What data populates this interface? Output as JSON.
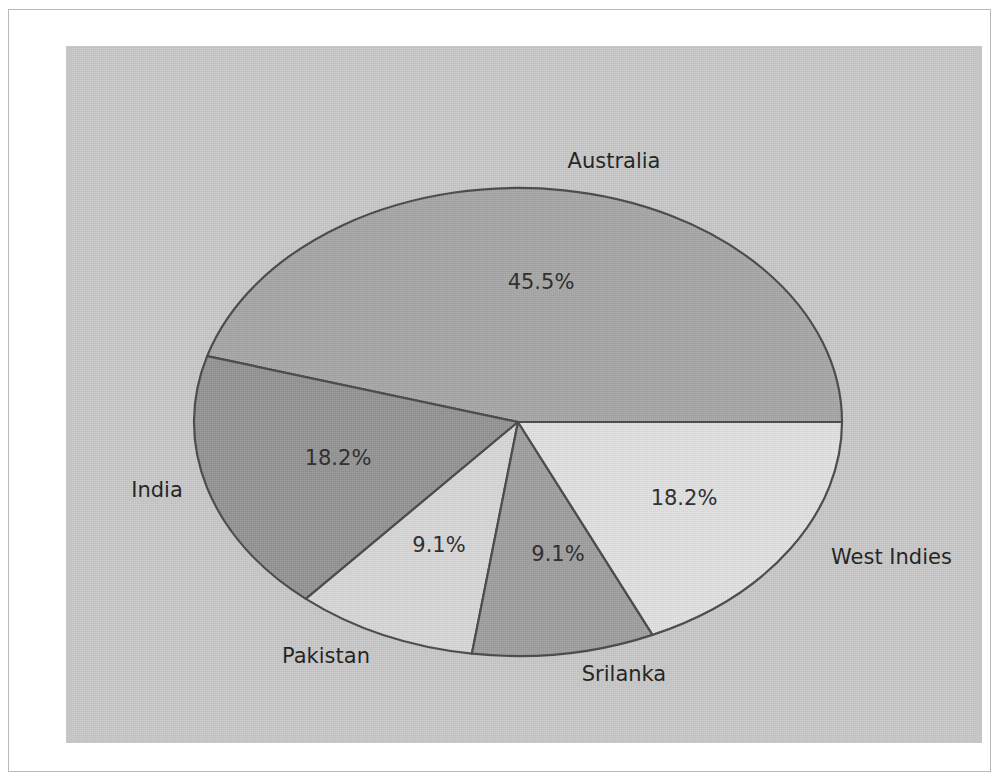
{
  "figure": {
    "panel_background": "#c9c9c9",
    "page_background": "#ffffff",
    "border_color": "#b9b9b9"
  },
  "chart_data": {
    "type": "pie",
    "title": "",
    "xlabel": "",
    "ylabel": "",
    "legend_position": "none",
    "grid": false,
    "labels_outside": true,
    "autopct": "%.1f%%",
    "start_angle_deg": 0,
    "direction": "counterclockwise",
    "categories": [
      "Australia",
      "West Indies",
      "Srilanka",
      "Pakistan",
      "India"
    ],
    "values": [
      45.5,
      18.2,
      9.1,
      9.1,
      18.2
    ],
    "pct_labels": [
      "45.5%",
      "18.2%",
      "9.1%",
      "9.1%",
      "18.2%"
    ],
    "colors": [
      "#a8a8a8",
      "#959595",
      "#d8d8d8",
      "#a0a0a0",
      "#e2e2e2"
    ],
    "slices": [
      {
        "name": "Australia",
        "pct_label": "45.5%",
        "value": 45.5,
        "color": "#a8a8a8",
        "pct_x": 532,
        "pct_y": 273,
        "label_x": 605,
        "label_y": 152,
        "label_anchor": "middle"
      },
      {
        "name": "West Indies",
        "pct_label": "18.2%",
        "value": 18.2,
        "color": "#959595",
        "pct_x": 675,
        "pct_y": 489,
        "label_x": 822,
        "label_y": 548,
        "label_anchor": "start"
      },
      {
        "name": "Srilanka",
        "pct_label": "9.1%",
        "value": 9.1,
        "color": "#d8d8d8",
        "pct_x": 549,
        "pct_y": 545,
        "label_x": 615,
        "label_y": 665,
        "label_anchor": "middle"
      },
      {
        "name": "Pakistan",
        "pct_label": "9.1%",
        "value": 9.1,
        "color": "#a0a0a0",
        "pct_x": 430,
        "pct_y": 536,
        "label_x": 317,
        "label_y": 647,
        "label_anchor": "middle"
      },
      {
        "name": "India",
        "pct_label": "18.2%",
        "value": 18.2,
        "color": "#e2e2e2",
        "pct_x": 329,
        "pct_y": 449,
        "label_x": 148,
        "label_y": 481,
        "label_anchor": "middle"
      }
    ],
    "geometry": {
      "center_x": 509,
      "center_y": 412,
      "radius_x": 324,
      "radius_y": 234
    }
  }
}
